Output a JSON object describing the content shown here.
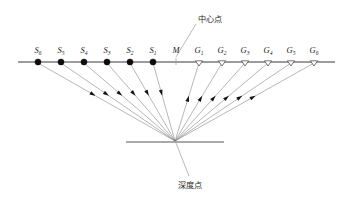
{
  "diagram": {
    "title_center": "中心点",
    "title_depth": "深度点",
    "midpoint_label": "M",
    "surface": {
      "x1": 18,
      "x2": 335,
      "y": 62
    },
    "reflector": {
      "x1": 126,
      "x2": 224,
      "y": 142
    },
    "depth_point": {
      "x": 175,
      "y": 141
    },
    "center_leader": {
      "x1": 176,
      "y1": 57,
      "x2": 196,
      "y2": 24
    },
    "depth_leader": {
      "x1": 176,
      "y1": 143,
      "x2": 189,
      "y2": 176
    },
    "center_label_pos": {
      "x": 198,
      "y": 22
    },
    "depth_label_pos": {
      "x": 190,
      "y": 188
    },
    "midpoint_pos": {
      "x": 176,
      "y": 62
    },
    "sources": [
      {
        "id": "S6",
        "base": "S",
        "sub": "6",
        "x": 38,
        "y": 62
      },
      {
        "id": "S5",
        "base": "S",
        "sub": "5",
        "x": 61,
        "y": 62
      },
      {
        "id": "S4",
        "base": "S",
        "sub": "4",
        "x": 84,
        "y": 62
      },
      {
        "id": "S3",
        "base": "S",
        "sub": "3",
        "x": 107,
        "y": 62
      },
      {
        "id": "S2",
        "base": "S",
        "sub": "2",
        "x": 130,
        "y": 62
      },
      {
        "id": "S1",
        "base": "S",
        "sub": "1",
        "x": 153,
        "y": 62
      }
    ],
    "receivers": [
      {
        "id": "G1",
        "base": "G",
        "sub": "1",
        "x": 199,
        "y": 62
      },
      {
        "id": "G2",
        "base": "G",
        "sub": "2",
        "x": 222,
        "y": 62
      },
      {
        "id": "G3",
        "base": "G",
        "sub": "3",
        "x": 245,
        "y": 62
      },
      {
        "id": "G4",
        "base": "G",
        "sub": "4",
        "x": 268,
        "y": 62
      },
      {
        "id": "G5",
        "base": "G",
        "sub": "5",
        "x": 291,
        "y": 62
      },
      {
        "id": "G6",
        "base": "G",
        "sub": "6",
        "x": 314,
        "y": 62
      }
    ],
    "colors": {
      "surface": "#3a3a3a",
      "ray": "#7a7a7a",
      "source_marker": "#0d0d0d",
      "receiver_marker": "#ffffff",
      "reflector": "#555555",
      "text": "#1a1a1a",
      "background": "#ffffff"
    }
  }
}
